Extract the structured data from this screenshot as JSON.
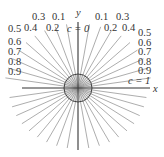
{
  "diagram": {
    "type": "family-of-lines-through-origin",
    "axes": {
      "x_label": "x",
      "y_label": "y"
    },
    "special_labels": {
      "vertical": "c = 0",
      "horizontal": "c = 1"
    },
    "top_left_labels": [
      "0.3",
      "0.1",
      "0.5",
      "0.4",
      "0.2",
      "0.6",
      "0.7",
      "0.8",
      "0.9"
    ],
    "top_right_labels": [
      "0.1",
      "0.3",
      "0.2",
      "0.4",
      "0.5",
      "0.6",
      "0.7",
      "0.8",
      "0.9"
    ],
    "c_values": [
      0.1,
      0.2,
      0.3,
      0.4,
      0.5,
      0.6,
      0.7,
      0.8,
      0.9
    ],
    "colors": {
      "rays": "#8a8a8a",
      "axes": "#333333",
      "text": "#333333"
    }
  },
  "labels": {
    "x": "x",
    "y": "y",
    "c0": "c = 0",
    "c1": "c = 1",
    "l03": "0.3",
    "l01": "0.1",
    "l05": "0.5",
    "l04": "0.4",
    "l02": "0.2",
    "l06": "0.6",
    "l07": "0.7",
    "l08": "0.8",
    "l09": "0.9",
    "r01": "0.1",
    "r03": "0.3",
    "r02": "0.2",
    "r04": "0.4",
    "r05": "0.5",
    "r06": "0.6",
    "r07": "0.7",
    "r08": "0.8",
    "r09": "0.9"
  }
}
